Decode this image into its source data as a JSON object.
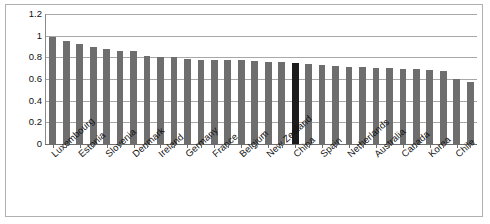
{
  "chart_data": {
    "type": "bar",
    "title": "",
    "xlabel": "",
    "ylabel": "",
    "ylim": [
      0,
      1.2
    ],
    "ytick_labels": [
      "0",
      "0.2",
      "0.4",
      "0.6",
      "0.8",
      "1",
      "1.2"
    ],
    "ytick_values": [
      0,
      0.2,
      0.4,
      0.6,
      0.8,
      1,
      1.2
    ],
    "grid": true,
    "legend": "none",
    "highlight_category": "China",
    "highlight_color": "#1c1c1c",
    "bar_color": "#6e6e6e",
    "label_every_nth": 2,
    "categories": [
      "Luxembourg",
      "",
      "Estonia",
      "",
      "Slovenia",
      "",
      "Denmark",
      "",
      "Ireland",
      "",
      "Germany",
      "",
      "France",
      "",
      "Belgium",
      "",
      "New Zealand",
      "",
      "China",
      "",
      "Spain",
      "",
      "Netherlands",
      "",
      "Australia",
      "",
      "Canada",
      "",
      "Korea",
      "",
      "Chile",
      ""
    ],
    "labeled_categories": [
      "Luxembourg",
      "Estonia",
      "Slovenia",
      "Denmark",
      "Ireland",
      "Germany",
      "France",
      "Belgium",
      "New Zealand",
      "China",
      "Spain",
      "Netherlands",
      "Australia",
      "Canada",
      "Korea",
      "Chile"
    ],
    "values": [
      0.99,
      0.95,
      0.92,
      0.9,
      0.88,
      0.855,
      0.855,
      0.81,
      0.8,
      0.8,
      0.785,
      0.78,
      0.775,
      0.775,
      0.775,
      0.77,
      0.76,
      0.755,
      0.75,
      0.74,
      0.725,
      0.72,
      0.715,
      0.71,
      0.705,
      0.7,
      0.695,
      0.69,
      0.685,
      0.67,
      0.6,
      0.575
    ]
  }
}
